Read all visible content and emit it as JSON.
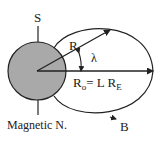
{
  "labels": {
    "south": "S",
    "radius": "R",
    "latitude": "λ",
    "r0_main": "R",
    "r0_sub": "o",
    "r0_eq": "= L R",
    "r0_sub2": "E",
    "field": "B",
    "north": "Magnetic N."
  },
  "colors": {
    "planet_fill": "#a9a9a9",
    "stroke": "#222222"
  }
}
